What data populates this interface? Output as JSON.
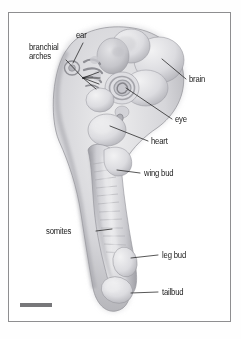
{
  "figure": {
    "title": "",
    "background_color": "#ffffff",
    "frame_color": "#8e8e90",
    "ink_color": "#1a1a1a",
    "body_fill_light": "#e2e2e4",
    "body_fill_mid": "#c4c4c8",
    "body_fill_dark": "#9b9ba0",
    "scale_bar": {
      "name": "scale-bar",
      "color": "#77777a",
      "caption": ""
    }
  },
  "labels": [
    {
      "id": "ear",
      "text": "ear",
      "align": "center"
    },
    {
      "id": "branchial-arches",
      "text": "branchial\narches",
      "line1": "branchial",
      "line2": "arches",
      "align": "left"
    },
    {
      "id": "brain",
      "text": "brain",
      "align": "left"
    },
    {
      "id": "eye",
      "text": "eye",
      "align": "left"
    },
    {
      "id": "heart",
      "text": "heart",
      "align": "left"
    },
    {
      "id": "wing-bud",
      "text": "wing bud",
      "align": "left"
    },
    {
      "id": "somites",
      "text": "somites",
      "align": "right"
    },
    {
      "id": "leg-bud",
      "text": "leg bud",
      "align": "left"
    },
    {
      "id": "tailbud",
      "text": "tailbud",
      "align": "left"
    }
  ]
}
